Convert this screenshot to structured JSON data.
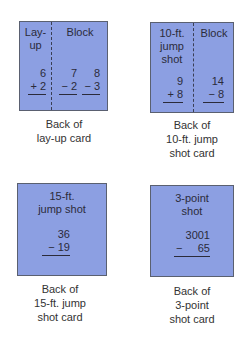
{
  "cards": [
    {
      "id": "lay-up",
      "caption": [
        "Back of",
        "lay-up card"
      ],
      "sections": [
        {
          "heading": [
            "Lay-",
            "up"
          ],
          "problems": [
            {
              "top": "6",
              "op": "+",
              "bottom": "2"
            }
          ]
        },
        {
          "heading": [
            "Block"
          ],
          "problems": [
            {
              "top": "7",
              "op": "−",
              "bottom": "2"
            },
            {
              "top": "8",
              "op": "−",
              "bottom": "3"
            }
          ]
        }
      ]
    },
    {
      "id": "10-ft-jump-shot",
      "caption": [
        "Back of",
        "10-ft. jump",
        "shot card"
      ],
      "sections": [
        {
          "heading": [
            "10-ft.",
            "jump",
            "shot"
          ],
          "problems": [
            {
              "top": "9",
              "op": "+",
              "bottom": "8"
            }
          ]
        },
        {
          "heading": [
            "Block"
          ],
          "problems": [
            {
              "top": "14",
              "op": "−",
              "bottom": "8"
            }
          ]
        }
      ]
    },
    {
      "id": "15-ft-jump-shot",
      "caption": [
        "Back of",
        "15-ft. jump",
        "shot card"
      ],
      "sections": [
        {
          "heading": [
            "15-ft.",
            "jump shot"
          ],
          "problems": [
            {
              "top": "36",
              "op": "−",
              "bottom": "19"
            }
          ]
        }
      ]
    },
    {
      "id": "3-point-shot",
      "caption": [
        "Back of",
        "3-point",
        "shot card"
      ],
      "sections": [
        {
          "heading": [
            "3-point",
            "shot"
          ],
          "problems": [
            {
              "top": "3001",
              "op": "−",
              "bottom": "65"
            }
          ]
        }
      ]
    }
  ],
  "colors": {
    "card_fill": "#8c9fe2",
    "card_border": "#5a6070",
    "text": "#2b2b3a"
  }
}
